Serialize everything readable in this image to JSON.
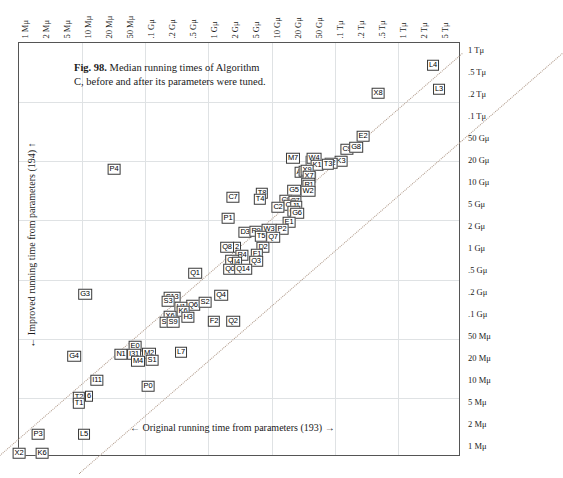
{
  "figure": {
    "caption_bold": "Fig. 98.",
    "caption_text": " Median running times of Algorithm C, before and after its parameters were tuned."
  },
  "axes": {
    "x_title": "← Original running time from parameters (193) →",
    "y_title": "← Improved running time from parameters (194) ↑",
    "x_ticks": [
      "1 Mμ",
      "2 Mμ",
      "5 Mμ",
      "10 Mμ",
      "20 Mμ",
      "50 Mμ",
      ".1 Gμ",
      ".2 Gμ",
      ".5 Gμ",
      "1 Gμ",
      "2 Gμ",
      "5 Gμ",
      "10 Gμ",
      "20 Gμ",
      "50 Gμ",
      ".1 Tμ",
      ".2 Tμ",
      ".5 Tμ",
      "1 Tμ",
      "2 Tμ",
      "5 Tμ"
    ],
    "y_ticks": [
      "1 Tμ",
      ".5 Tμ",
      ".2 Tμ",
      ".1 Tμ",
      "50 Gμ",
      "20 Gμ",
      "10 Gμ",
      "5 Gμ",
      "2 Gμ",
      "1 Gμ",
      ".5 Gμ",
      ".2 Gμ",
      ".1 Gμ",
      "50 Mμ",
      "20 Mμ",
      "10 Mμ",
      "5 Mμ",
      "2 Mμ",
      "1 Mμ"
    ]
  },
  "colors": {
    "frame": "#555555",
    "grid": "#dfe2e4",
    "diagonal": "#b09a8a",
    "label_border": "#3a3a3a",
    "text": "#1a1a1a"
  },
  "chart_data": {
    "type": "scatter",
    "title": "Median running times of Algorithm C, before and after its parameters were tuned.",
    "xlabel": "← Original running time from parameters (193) →",
    "ylabel": "← Improved running time from parameters (194) ↑",
    "xlim": [
      "1 Mμ",
      "5 Tμ"
    ],
    "ylim": [
      "1 Mμ",
      "1 Tμ"
    ],
    "xscale": "log",
    "yscale": "log",
    "grid": true,
    "annotations": [
      "two dotted diagonal reference lines running lower-left to upper-right"
    ],
    "points": [
      {
        "label": "L4",
        "x": 432,
        "y": 64
      },
      {
        "label": "L3",
        "x": 438,
        "y": 88
      },
      {
        "label": "X8",
        "x": 377,
        "y": 92
      },
      {
        "label": "E2",
        "x": 362,
        "y": 135
      },
      {
        "label": "C9",
        "x": 346,
        "y": 148
      },
      {
        "label": "G8",
        "x": 355,
        "y": 146
      },
      {
        "label": "K3",
        "x": 340,
        "y": 160
      },
      {
        "label": "M7",
        "x": 292,
        "y": 157
      },
      {
        "label": "V4",
        "x": 311,
        "y": 160
      },
      {
        "label": "W4",
        "x": 313,
        "y": 157
      },
      {
        "label": "K2",
        "x": 330,
        "y": 162
      },
      {
        "label": "K1",
        "x": 316,
        "y": 164
      },
      {
        "label": "T3",
        "x": 327,
        "y": 163
      },
      {
        "label": "A8",
        "x": 300,
        "y": 171
      },
      {
        "label": "K8",
        "x": 304,
        "y": 170
      },
      {
        "label": "X9",
        "x": 306,
        "y": 169
      },
      {
        "label": "I7",
        "x": 310,
        "y": 176
      },
      {
        "label": "X7",
        "x": 308,
        "y": 175
      },
      {
        "label": "Q5",
        "x": 307,
        "y": 182
      },
      {
        "label": "R1",
        "x": 308,
        "y": 184
      },
      {
        "label": "W2",
        "x": 307,
        "y": 190
      },
      {
        "label": "G5",
        "x": 293,
        "y": 189
      },
      {
        "label": "T8",
        "x": 261,
        "y": 192
      },
      {
        "label": "T4",
        "x": 259,
        "y": 198
      },
      {
        "label": "C7",
        "x": 232,
        "y": 196
      },
      {
        "label": "C8",
        "x": 285,
        "y": 199
      },
      {
        "label": "C7b",
        "x": 294,
        "y": 200
      },
      {
        "label": "C4",
        "x": 289,
        "y": 204
      },
      {
        "label": "J1",
        "x": 295,
        "y": 205
      },
      {
        "label": "C2",
        "x": 277,
        "y": 206
      },
      {
        "label": "C6",
        "x": 293,
        "y": 210
      },
      {
        "label": "G6",
        "x": 296,
        "y": 212
      },
      {
        "label": "P1",
        "x": 227,
        "y": 217
      },
      {
        "label": "E1",
        "x": 288,
        "y": 221
      },
      {
        "label": "D3",
        "x": 244,
        "y": 231
      },
      {
        "label": "R9",
        "x": 255,
        "y": 230
      },
      {
        "label": "W3",
        "x": 268,
        "y": 228
      },
      {
        "label": "P2",
        "x": 281,
        "y": 228
      },
      {
        "label": "T5",
        "x": 260,
        "y": 235
      },
      {
        "label": "Q7",
        "x": 272,
        "y": 236
      },
      {
        "label": "Q8",
        "x": 226,
        "y": 246
      },
      {
        "label": "2",
        "x": 236,
        "y": 246
      },
      {
        "label": "D2",
        "x": 262,
        "y": 246
      },
      {
        "label": "R4",
        "x": 241,
        "y": 254
      },
      {
        "label": "F1",
        "x": 256,
        "y": 253
      },
      {
        "label": "Q4b",
        "x": 231,
        "y": 259
      },
      {
        "label": "I4",
        "x": 236,
        "y": 261
      },
      {
        "label": "Q3",
        "x": 255,
        "y": 260
      },
      {
        "label": "Q1",
        "x": 194,
        "y": 272
      },
      {
        "label": "Q0",
        "x": 229,
        "y": 268
      },
      {
        "label": "Q14",
        "x": 242,
        "y": 268
      },
      {
        "label": "G3",
        "x": 84,
        "y": 293
      },
      {
        "label": "S13",
        "x": 171,
        "y": 296
      },
      {
        "label": "S3",
        "x": 167,
        "y": 300
      },
      {
        "label": "Q6",
        "x": 192,
        "y": 304
      },
      {
        "label": "S2",
        "x": 204,
        "y": 301
      },
      {
        "label": "H1",
        "x": 180,
        "y": 306
      },
      {
        "label": "K6",
        "x": 182,
        "y": 310
      },
      {
        "label": "Q4",
        "x": 220,
        "y": 294
      },
      {
        "label": "X6",
        "x": 169,
        "y": 315
      },
      {
        "label": "H3",
        "x": 187,
        "y": 316
      },
      {
        "label": "S4",
        "x": 165,
        "y": 321
      },
      {
        "label": "S9",
        "x": 172,
        "y": 321
      },
      {
        "label": "F2",
        "x": 213,
        "y": 320
      },
      {
        "label": "Q2",
        "x": 232,
        "y": 320
      },
      {
        "label": "E0",
        "x": 134,
        "y": 345
      },
      {
        "label": "N1",
        "x": 120,
        "y": 353
      },
      {
        "label": "I31",
        "x": 133,
        "y": 353
      },
      {
        "label": "M2",
        "x": 148,
        "y": 352
      },
      {
        "label": "M4",
        "x": 137,
        "y": 360
      },
      {
        "label": "S1",
        "x": 151,
        "y": 359
      },
      {
        "label": "L7",
        "x": 180,
        "y": 351
      },
      {
        "label": "G4",
        "x": 73,
        "y": 355
      },
      {
        "label": "P4",
        "x": 113,
        "y": 168
      },
      {
        "label": "I11",
        "x": 96,
        "y": 379
      },
      {
        "label": "P0",
        "x": 147,
        "y": 385
      },
      {
        "label": "T2",
        "x": 78,
        "y": 396
      },
      {
        "label": "T1",
        "x": 78,
        "y": 402
      },
      {
        "label": "6",
        "x": 88,
        "y": 395
      },
      {
        "label": "P3",
        "x": 37,
        "y": 433
      },
      {
        "label": "L5",
        "x": 83,
        "y": 433
      },
      {
        "label": "X2",
        "x": 18,
        "y": 452
      },
      {
        "label": "K6b",
        "x": 41,
        "y": 452
      }
    ]
  }
}
